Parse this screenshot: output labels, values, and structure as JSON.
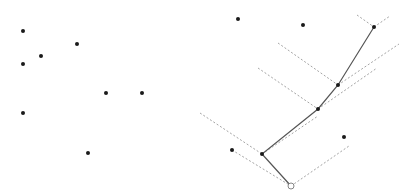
{
  "colors": {
    "point": "#1a1a1a",
    "path": "#555555",
    "dashed": "#9a9a9a",
    "origin_stroke": "#777777"
  },
  "panels": [
    {
      "name": "input-points",
      "points": [
        [
          23,
          31
        ],
        [
          77,
          44
        ],
        [
          41,
          56
        ],
        [
          23,
          64
        ],
        [
          106,
          93
        ],
        [
          142,
          93
        ],
        [
          23,
          113
        ],
        [
          88,
          153
        ]
      ]
    },
    {
      "name": "chain-construction",
      "origin": [
        291,
        186
      ],
      "points": [
        [
          238,
          19
        ],
        [
          303,
          25
        ],
        [
          374,
          27
        ],
        [
          338,
          85
        ],
        [
          318,
          109
        ],
        [
          262,
          154
        ],
        [
          232,
          150
        ],
        [
          344,
          137
        ]
      ],
      "chain": [
        [
          291,
          186
        ],
        [
          262,
          154
        ],
        [
          318,
          109
        ],
        [
          338,
          85
        ],
        [
          374,
          27
        ]
      ],
      "dashed_segments": [
        [
          [
            357,
            15
          ],
          [
            374,
            27
          ]
        ],
        [
          [
            374,
            27
          ],
          [
            390,
            16
          ]
        ],
        [
          [
            278,
            43
          ],
          [
            338,
            85
          ]
        ],
        [
          [
            338,
            85
          ],
          [
            399,
            44
          ]
        ],
        [
          [
            258,
            68
          ],
          [
            318,
            109
          ]
        ],
        [
          [
            318,
            109
          ],
          [
            377,
            68
          ]
        ],
        [
          [
            200,
            113
          ],
          [
            262,
            154
          ]
        ],
        [
          [
            262,
            154
          ],
          [
            318,
            116
          ]
        ],
        [
          [
            232,
            150
          ],
          [
            291,
            186
          ]
        ],
        [
          [
            291,
            186
          ],
          [
            349,
            146
          ]
        ]
      ]
    }
  ]
}
